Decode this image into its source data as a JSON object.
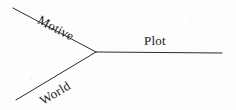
{
  "diagram": {
    "type": "three-branch-vector-diagram",
    "background_color": "#fdfdfd",
    "stroke_color": "#2b2b2b",
    "stroke_width": 1,
    "text_color": "#1a1a1a",
    "junction": {
      "x": 96,
      "y": 52
    },
    "branches": [
      {
        "name": "motive",
        "label": "Motive",
        "from": {
          "x": 13,
          "y": 8
        },
        "to": {
          "x": 96,
          "y": 52
        },
        "label_rotation_deg": 28
      },
      {
        "name": "world",
        "label": "World",
        "from": {
          "x": 16,
          "y": 100
        },
        "to": {
          "x": 96,
          "y": 52
        },
        "label_rotation_deg": -31
      },
      {
        "name": "plot",
        "label": "Plot",
        "from": {
          "x": 96,
          "y": 52
        },
        "to": {
          "x": 222,
          "y": 53
        },
        "label_rotation_deg": 0
      }
    ]
  }
}
